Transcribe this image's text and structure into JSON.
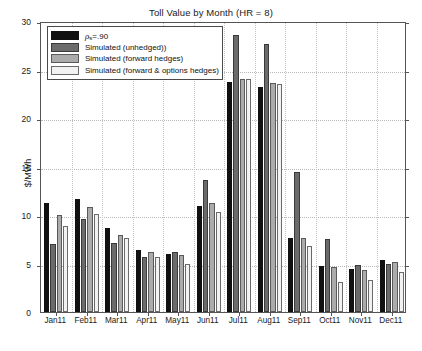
{
  "chart_data": {
    "type": "bar",
    "title": "Toll Value by Month (HR = 8)",
    "xlabel": "",
    "ylabel": "$/MWh",
    "ylim": [
      0,
      30
    ],
    "yticks": [
      0,
      5,
      10,
      15,
      20,
      25,
      30
    ],
    "ytick_labels": [
      "0",
      "5",
      "10",
      "15",
      "20",
      "25",
      "30"
    ],
    "grid": true,
    "legend_position": "upper left",
    "categories": [
      "Jan11",
      "Feb11",
      "Mar11",
      "Apr11",
      "May11",
      "Jun11",
      "Jul11",
      "Aug11",
      "Sep11",
      "Oct11",
      "Nov11",
      "Dec11"
    ],
    "series": [
      {
        "name": "rho_s=.90",
        "label_prefix": "ρ",
        "label_sub": "s",
        "label_suffix": "=.90",
        "color": "#111111",
        "values": [
          11.2,
          11.6,
          8.7,
          6.4,
          6.0,
          10.9,
          23.7,
          23.2,
          7.6,
          4.7,
          4.4,
          5.4
        ]
      },
      {
        "name": "Simulated (unhedged))",
        "color": "#6b6b6b",
        "values": [
          7.0,
          9.6,
          7.1,
          5.7,
          6.2,
          13.6,
          28.6,
          27.6,
          14.4,
          7.5,
          4.8,
          4.9
        ]
      },
      {
        "name": "Simulated (forward hedges)",
        "color": "#ababab",
        "values": [
          10.0,
          10.8,
          7.9,
          6.2,
          5.9,
          11.2,
          24.0,
          23.6,
          7.6,
          4.6,
          4.3,
          5.2
        ]
      },
      {
        "name": "Simulated (forward & options hedges)",
        "color": "#f2f2f2",
        "values": [
          8.9,
          10.1,
          7.6,
          5.7,
          4.9,
          10.3,
          24.0,
          23.5,
          6.8,
          3.1,
          3.3,
          4.1
        ]
      }
    ]
  },
  "legend": {
    "entries": [
      "ρs=.90",
      "Simulated (unhedged))",
      "Simulated (forward hedges)",
      "Simulated (forward & options hedges)"
    ]
  }
}
